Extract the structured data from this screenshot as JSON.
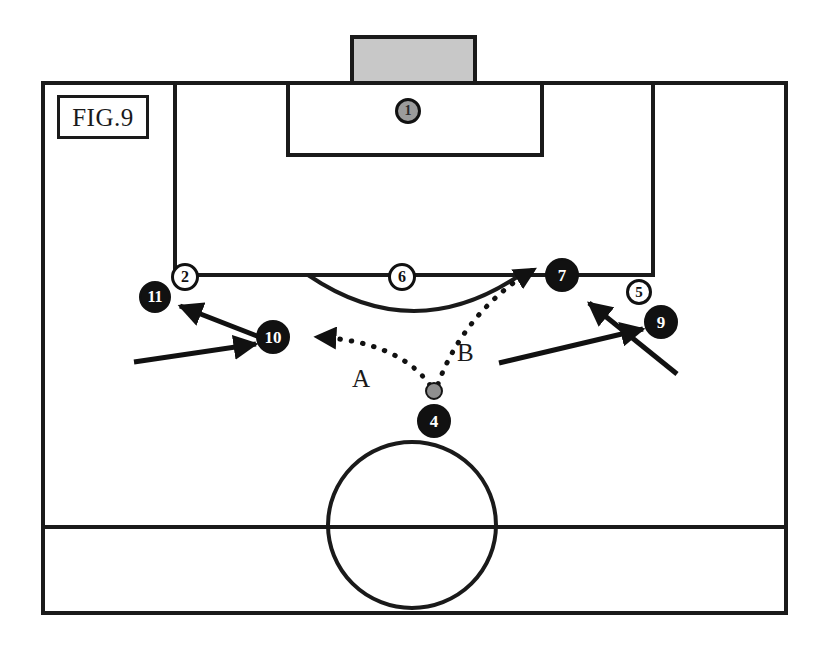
{
  "figure": {
    "label": "FIG.9",
    "colors": {
      "line": "#1a1a1a",
      "goal_fill": "#c8c8c8",
      "attacking_player": "#111111",
      "defending_player": "#ffffff",
      "goalkeeper_fill": "#9b9b9b",
      "ball_fill": "#8f8f8f",
      "background": "#ffffff"
    }
  },
  "field": {
    "name": "soccer-half-pitch",
    "boundary": {
      "x": 43,
      "y": 83,
      "width": 743,
      "height": 530
    },
    "goal": {
      "x": 352,
      "y": 37,
      "width": 123,
      "height": 46
    },
    "penalty_area": {
      "x": 175,
      "y": 83,
      "width": 478,
      "height": 192
    },
    "goal_area": {
      "x": 288,
      "y": 83,
      "width": 254,
      "height": 72
    },
    "penalty_arc": {
      "center_x": 414,
      "top_y": 275,
      "depth": 36,
      "half_width": 106
    },
    "halfway_line_y": 527,
    "center_circle": {
      "cx": 412,
      "cy": 525,
      "rx": 84,
      "ry": 83
    }
  },
  "players": [
    {
      "id": "p1",
      "number": "1",
      "team": "goalkeeper",
      "x": 408,
      "y": 111,
      "r": 13,
      "font_size": 14
    },
    {
      "id": "p2",
      "number": "2",
      "team": "defending",
      "x": 185,
      "y": 277,
      "r": 14,
      "font_size": 16
    },
    {
      "id": "p6",
      "number": "6",
      "team": "defending",
      "x": 402,
      "y": 277,
      "r": 14,
      "font_size": 16
    },
    {
      "id": "p5",
      "number": "5",
      "team": "defending",
      "x": 639,
      "y": 292,
      "r": 13,
      "font_size": 15
    },
    {
      "id": "p11",
      "number": "11",
      "team": "attacking",
      "x": 155,
      "y": 297,
      "r": 16,
      "font_size": 16
    },
    {
      "id": "p10",
      "number": "10",
      "team": "attacking",
      "x": 273,
      "y": 337,
      "r": 17,
      "font_size": 17
    },
    {
      "id": "p7",
      "number": "7",
      "team": "attacking",
      "x": 562,
      "y": 275,
      "r": 17,
      "font_size": 17
    },
    {
      "id": "p9",
      "number": "9",
      "team": "attacking",
      "x": 661,
      "y": 322,
      "r": 17,
      "font_size": 17
    },
    {
      "id": "p4",
      "number": "4",
      "team": "attacking",
      "x": 434,
      "y": 421,
      "r": 17,
      "font_size": 17
    }
  ],
  "ball": {
    "x": 434,
    "y": 391,
    "r": 9
  },
  "pass_routes": [
    {
      "id": "routeA",
      "label": "A",
      "label_x": 360,
      "label_y": 380,
      "from": "ball",
      "to": "player-10",
      "path": "M 430 385 C 408 355 370 340 318 337",
      "style": "dotted"
    },
    {
      "id": "routeB",
      "label": "B",
      "label_x": 464,
      "label_y": 354,
      "from": "ball",
      "to": "player-7",
      "path": "M 438 384 C 452 345 482 300 533 270",
      "style": "dotted"
    }
  ],
  "movement_arrows": [
    {
      "id": "arrow-10-to-11",
      "path": "M 280 345 L 176 304",
      "style": "solid"
    },
    {
      "id": "arrow-into-10",
      "path": "M 134 362 L 258 344",
      "style": "solid"
    },
    {
      "id": "arrow-into-9",
      "path": "M 499 363 L 645 328",
      "style": "solid"
    },
    {
      "id": "arrow-to-7",
      "path": "M 677 374 L 587 301",
      "style": "solid"
    }
  ]
}
